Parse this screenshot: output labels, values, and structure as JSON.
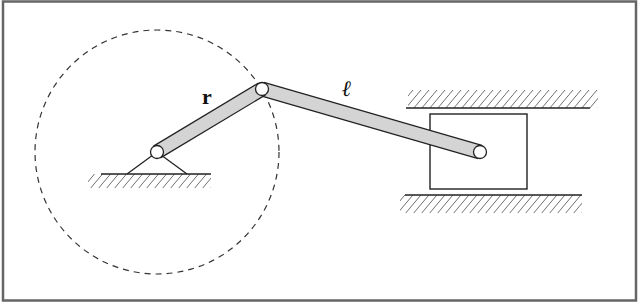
{
  "diagram": {
    "type": "slider-crank mechanism",
    "labels": {
      "crank": "r",
      "connecting_rod": "ℓ"
    },
    "colors": {
      "frame": "#555555",
      "line": "#222222",
      "link_fill": "#d4d4d4",
      "background": "#ffffff"
    },
    "elements": [
      "frame-border",
      "crank-path-circle",
      "fixed-pivot-support",
      "ground-hatch",
      "crank-link-r",
      "connecting-rod-l",
      "crank-pin",
      "slider-block",
      "upper-guide-rail",
      "lower-guide-rail",
      "piston-pin"
    ]
  }
}
